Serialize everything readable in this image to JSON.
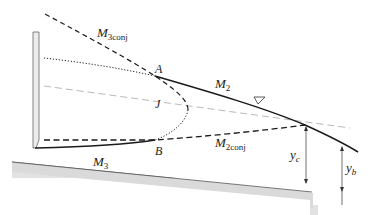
{
  "diagram": {
    "type": "gradually-varied-flow-profile",
    "colors": {
      "line": "#1a1a1a",
      "light_dash": "#9a9a9a",
      "bed_fill": "#dcdcdc",
      "bed_edge": "#555555",
      "gate_fill": "#e8e8e8",
      "gate_edge": "#555555"
    },
    "labels": {
      "m3conj": {
        "main": "M",
        "sub": "3conj"
      },
      "m2": {
        "main": "M",
        "sub": "2"
      },
      "m2conj": {
        "main": "M",
        "sub": "2conj"
      },
      "m3": {
        "main": "M",
        "sub": "3"
      },
      "point_a": "A",
      "point_b": "B",
      "point_j": "J",
      "yc": {
        "main": "y",
        "sub": "c"
      },
      "yb": {
        "main": "y",
        "sub": "b"
      }
    },
    "symbols": {
      "water_surface": "inverted-triangle"
    }
  }
}
